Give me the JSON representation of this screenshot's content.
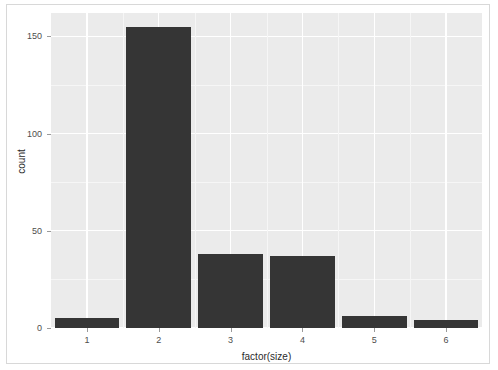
{
  "chart_data": {
    "type": "bar",
    "title": "",
    "subtitle": "",
    "xlabel": "factor(size)",
    "ylabel": "count",
    "categories": [
      "1",
      "2",
      "3",
      "4",
      "5",
      "6"
    ],
    "values": [
      5,
      155,
      38,
      37,
      6,
      4
    ],
    "ylim": [
      0,
      162
    ],
    "yticks": [
      0,
      50,
      100,
      150
    ],
    "ytick_labels": [
      "0",
      "50",
      "100",
      "150"
    ],
    "yminor_ticks": [
      25,
      75,
      125
    ],
    "grid": true,
    "legend": "none",
    "bar_color": "#353535",
    "panel_background": "#ebebeb",
    "gridline_color": "#ffffff",
    "axis_text_color": "#4d4d4d",
    "axis_title_color": "#2b2b2b",
    "border_color": "#d8d8d8",
    "page_background": "#ffffff"
  }
}
